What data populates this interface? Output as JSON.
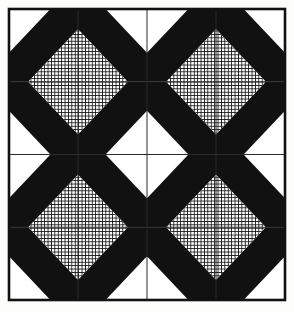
{
  "figure": {
    "kind": "pattern-illustration",
    "caption": "",
    "canvas": {
      "width": 294,
      "height": 312
    },
    "background_color": "#fdfdfc"
  },
  "palette": {
    "ink": "#111111",
    "solid_black": "#111111",
    "paper_white": "#ffffff",
    "hatch_line": "#141414",
    "border": "#111111",
    "grid_line": "#2b2b2b",
    "page_background": "#fdfdfc"
  },
  "frame": {
    "left": 9,
    "top": 9,
    "right": 285,
    "bottom": 300,
    "stroke_width": 2.6,
    "label": "outer-border"
  },
  "grid": {
    "columns": 4,
    "rows": 4,
    "cell_width": 69,
    "cell_height": 72.75,
    "x_lines": [
      9,
      78,
      147,
      216,
      285
    ],
    "y_lines": [
      9,
      81.75,
      154.5,
      227.25,
      300
    ],
    "line_width": 1.0,
    "visible": true
  },
  "hatch": {
    "name": "crosshatch-fill",
    "spacing": 3.4,
    "stroke_width": 1.05,
    "angles_deg": [
      0,
      90
    ],
    "color": "#141414"
  },
  "tile": {
    "name": "diagonal-band-tile",
    "description": "Unit cell: white triangle at upper-right, wide solid black diagonal band, crosshatched diagonal band, white triangle at lower-left.",
    "bands_normalized": [
      {
        "band": "white-triangle-upper",
        "fill": "white",
        "from": 0.0,
        "to": 0.3
      },
      {
        "band": "solid-black-band",
        "fill": "black",
        "from": 0.3,
        "to": 0.64
      },
      {
        "band": "crosshatch-band",
        "fill": "hatch",
        "from": 0.64,
        "to": 1.0
      },
      {
        "band": "white-triangle-lower",
        "fill": "white",
        "from": 1.0,
        "to": 1.22
      }
    ]
  },
  "cells": [
    {
      "row": 0,
      "col": 0,
      "name": "cell-r0c0",
      "flip_x": false,
      "flip_y": false
    },
    {
      "row": 0,
      "col": 1,
      "name": "cell-r0c1",
      "flip_x": true,
      "flip_y": false
    },
    {
      "row": 0,
      "col": 2,
      "name": "cell-r0c2",
      "flip_x": false,
      "flip_y": false
    },
    {
      "row": 0,
      "col": 3,
      "name": "cell-r0c3",
      "flip_x": true,
      "flip_y": false
    },
    {
      "row": 1,
      "col": 0,
      "name": "cell-r1c0",
      "flip_x": false,
      "flip_y": true
    },
    {
      "row": 1,
      "col": 1,
      "name": "cell-r1c1",
      "flip_x": true,
      "flip_y": true
    },
    {
      "row": 1,
      "col": 2,
      "name": "cell-r1c2",
      "flip_x": false,
      "flip_y": true
    },
    {
      "row": 1,
      "col": 3,
      "name": "cell-r1c3",
      "flip_x": true,
      "flip_y": true
    },
    {
      "row": 2,
      "col": 0,
      "name": "cell-r2c0",
      "flip_x": false,
      "flip_y": false
    },
    {
      "row": 2,
      "col": 1,
      "name": "cell-r2c1",
      "flip_x": true,
      "flip_y": false
    },
    {
      "row": 2,
      "col": 2,
      "name": "cell-r2c2",
      "flip_x": false,
      "flip_y": false
    },
    {
      "row": 2,
      "col": 3,
      "name": "cell-r2c3",
      "flip_x": true,
      "flip_y": false
    },
    {
      "row": 3,
      "col": 0,
      "name": "cell-r3c0",
      "flip_x": false,
      "flip_y": true
    },
    {
      "row": 3,
      "col": 1,
      "name": "cell-r3c1",
      "flip_x": true,
      "flip_y": true
    },
    {
      "row": 3,
      "col": 2,
      "name": "cell-r3c2",
      "flip_x": false,
      "flip_y": true
    },
    {
      "row": 3,
      "col": 3,
      "name": "cell-r3c3",
      "flip_x": true,
      "flip_y": true
    }
  ]
}
